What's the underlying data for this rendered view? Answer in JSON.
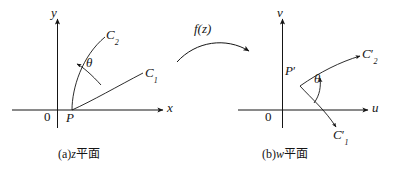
{
  "figure": {
    "background": "#ffffff",
    "ink_color": "#151515"
  },
  "panel_a": {
    "caption_prefix": "(a)",
    "caption_var": "z",
    "caption_cjk": "平面",
    "axis_y_label": "y",
    "axis_x_label": "x",
    "origin_label": "0",
    "point_label": "P",
    "curve1_label": "C",
    "curve1_sub": "1",
    "curve2_label": "C",
    "curve2_sub": "2",
    "angle_label": "θ"
  },
  "transform": {
    "label": "f(z)"
  },
  "panel_b": {
    "caption_prefix": "(b)",
    "caption_var": "w",
    "caption_cjk": "平面",
    "axis_v_label": "v",
    "axis_u_label": "u",
    "origin_label": "0",
    "point_label": "P",
    "point_prime": "′",
    "curve1_label": "C",
    "curve1_sub": "1",
    "curve1_prime": "′",
    "curve2_label": "C",
    "curve2_sub": "2",
    "curve2_prime": "′",
    "angle_label": "θ"
  }
}
